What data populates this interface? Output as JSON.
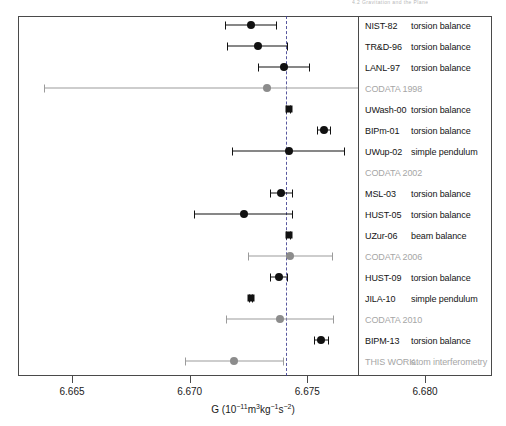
{
  "page_header_fragment": "4.2   Gravitation and the Plane",
  "chart_data": {
    "type": "scatter",
    "orientation": "horizontal-forest-plot",
    "title": "",
    "xlabel": "G (10−11m3kg−1s−2)",
    "xlabel_parts": {
      "symbol": "G",
      "open": " (10",
      "exp1": "−11",
      "unit1": "m",
      "exp2": "3",
      "unit2": "kg",
      "exp3": "−1",
      "unit3": "s",
      "exp4": "−2",
      "close": ")"
    },
    "ylabel": "",
    "xlim": [
      6.66252,
      6.68228
    ],
    "xticks": [
      6.665,
      6.67,
      6.675,
      6.68
    ],
    "xticklabels": [
      "6.665",
      "6.670",
      "6.675",
      "6.680"
    ],
    "grid": false,
    "legend": "inline-right-box",
    "reference_line": {
      "value": 6.67408,
      "style": "dashed",
      "color": "#3b3b8f",
      "label": "CODATA recommended value"
    },
    "colors": {
      "experiment_marker": "#111111",
      "codata_marker": "#8c8c8c",
      "experiment_errorbar": "#111111",
      "codata_errorbar": "#9b9b9b",
      "frame": "#4a4a4a",
      "reference_line": "#3b3b8f",
      "codata_text": "#a6a6a6",
      "experiment_text": "#141414"
    },
    "points": [
      {
        "label": "NIST-82",
        "method": "torsion balance",
        "value": 6.6726,
        "err_low": 0.0011,
        "err_high": 0.0011,
        "kind": "experiment",
        "marker": "circle"
      },
      {
        "label": "TR&D-96",
        "method": "torsion balance",
        "value": 6.6729,
        "err_low": 0.0013,
        "err_high": 0.0013,
        "kind": "experiment",
        "marker": "circle"
      },
      {
        "label": "LANL-97",
        "method": "torsion balance",
        "value": 6.674,
        "err_low": 0.0011,
        "err_high": 0.0011,
        "kind": "experiment",
        "marker": "circle"
      },
      {
        "label": "CODATA 1998",
        "method": "",
        "value": 6.6733,
        "err_low": 0.0095,
        "err_high": 0.0095,
        "kind": "codata",
        "marker": "circle"
      },
      {
        "label": "UWash-00",
        "method": "torsion balance",
        "value": 6.6742,
        "err_low": 0.0001,
        "err_high": 0.0001,
        "kind": "experiment",
        "marker": "square"
      },
      {
        "label": "BIPm-01",
        "method": "torsion balance",
        "value": 6.6757,
        "err_low": 0.0003,
        "err_high": 0.0003,
        "kind": "experiment",
        "marker": "circle"
      },
      {
        "label": "UWup-02",
        "method": "simple pendulum",
        "value": 6.6742,
        "err_low": 0.0024,
        "err_high": 0.0024,
        "kind": "experiment",
        "marker": "circle"
      },
      {
        "label": "CODATA 2002",
        "method": "",
        "value": 6.6742,
        "err_low": 0.0,
        "err_high": 0.0,
        "kind": "codata",
        "marker": "none"
      },
      {
        "label": "MSL-03",
        "method": "torsion balance",
        "value": 6.6739,
        "err_low": 0.0005,
        "err_high": 0.0005,
        "kind": "experiment",
        "marker": "circle"
      },
      {
        "label": "HUST-05",
        "method": "torsion balance",
        "value": 6.6723,
        "err_low": 0.0021,
        "err_high": 0.0021,
        "kind": "experiment",
        "marker": "circle"
      },
      {
        "label": "UZur-06",
        "method": "beam balance",
        "value": 6.6742,
        "err_low": 0.0001,
        "err_high": 0.0001,
        "kind": "experiment",
        "marker": "square"
      },
      {
        "label": "CODATA 2006",
        "method": "",
        "value": 6.67428,
        "err_low": 0.0018,
        "err_high": 0.0018,
        "kind": "codata",
        "marker": "circle"
      },
      {
        "label": "HUST-09",
        "method": "torsion balance",
        "value": 6.6738,
        "err_low": 0.0004,
        "err_high": 0.0004,
        "kind": "experiment",
        "marker": "circle"
      },
      {
        "label": "JILA-10",
        "method": "simple pendulum",
        "value": 6.6726,
        "err_low": 0.0001,
        "err_high": 0.0001,
        "kind": "experiment",
        "marker": "square"
      },
      {
        "label": "CODATA 2010",
        "method": "",
        "value": 6.67384,
        "err_low": 0.0023,
        "err_high": 0.0023,
        "kind": "codata",
        "marker": "circle"
      },
      {
        "label": "BIPM-13",
        "method": "torsion balance",
        "value": 6.6756,
        "err_low": 0.0003,
        "err_high": 0.0003,
        "kind": "experiment",
        "marker": "circle"
      },
      {
        "label": "THIS WORK",
        "method": "atom interferometry",
        "value": 6.6719,
        "err_low": 0.0021,
        "err_high": 0.0021,
        "kind": "codata",
        "marker": "circle"
      }
    ]
  }
}
